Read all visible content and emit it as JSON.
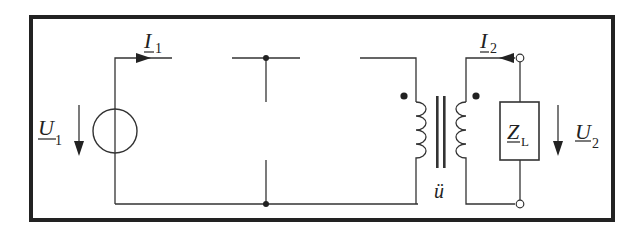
{
  "diagram": {
    "type": "circuit",
    "colors": {
      "line": "#333333",
      "frame": "#222222",
      "background": "#ffffff"
    },
    "labels": {
      "I1": {
        "main": "I",
        "sub": "1"
      },
      "I2": {
        "main": "I",
        "sub": "2"
      },
      "U1": {
        "main": "U",
        "sub": "1"
      },
      "U2": {
        "main": "U",
        "sub": "2"
      },
      "ZL": {
        "main": "Z",
        "sub": "L"
      },
      "ratio": "ü"
    },
    "components": [
      {
        "id": "source",
        "kind": "voltage-source",
        "label": "U1"
      },
      {
        "id": "transformer",
        "kind": "ideal-transformer",
        "label": "ü",
        "dot_marks": 2
      },
      {
        "id": "load",
        "kind": "impedance",
        "label": "ZL"
      },
      {
        "id": "terminals",
        "kind": "open-terminals",
        "count": 2
      },
      {
        "id": "nodes",
        "kind": "junction-dots",
        "count": 2
      }
    ]
  }
}
